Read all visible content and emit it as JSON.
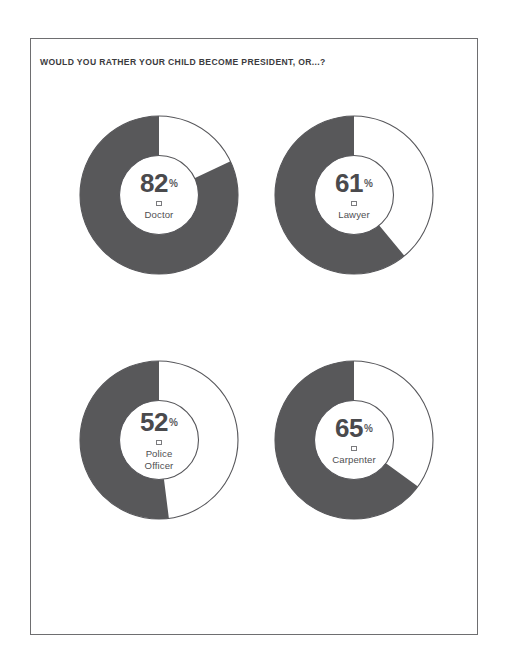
{
  "page": {
    "title": "WOULD YOU RATHER YOUR CHILD BECOME PRESIDENT, OR...?",
    "percent_sign": "%"
  },
  "colors": {
    "fill": "#58585a",
    "track": "#ffffff",
    "stroke": "#56565a",
    "text": "#4a4a4d",
    "border": "#6e6e70",
    "background": "#ffffff"
  },
  "chart_data": {
    "type": "pie",
    "title": "WOULD YOU RATHER YOUR CHILD BECOME PRESIDENT, OR...?",
    "subtitle": "",
    "xlabel": "",
    "ylabel": "",
    "units": "percent",
    "legend_position": "none",
    "grid": false,
    "note": "Four donut gauges; each shaded arc sweeps counter-clockwise from 12 o'clock and represents the share preferring that profession over president.",
    "categories": [
      "Doctor",
      "Lawyer",
      "Police Officer",
      "Carpenter"
    ],
    "values": [
      82,
      61,
      52,
      65
    ],
    "series": [
      {
        "name": "Would rather child become this than president",
        "values": [
          82,
          61,
          52,
          65
        ]
      }
    ],
    "charts": [
      {
        "label": "Doctor",
        "label_lines": [
          "Doctor"
        ],
        "value": 82,
        "display": "82",
        "remainder": 18
      },
      {
        "label": "Lawyer",
        "label_lines": [
          "Lawyer"
        ],
        "value": 61,
        "display": "61",
        "remainder": 39
      },
      {
        "label": "Police Officer",
        "label_lines": [
          "Police",
          "Officer"
        ],
        "value": 52,
        "display": "52",
        "remainder": 48
      },
      {
        "label": "Carpenter",
        "label_lines": [
          "Carpenter"
        ],
        "value": 65,
        "display": "65",
        "remainder": 35
      }
    ]
  }
}
